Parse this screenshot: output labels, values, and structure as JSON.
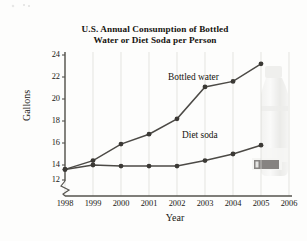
{
  "chart": {
    "title_line1": "U.S. Annual Consumption of Bottled",
    "title_line2": "Water or Diet Soda per Person",
    "xlabel": "Year",
    "ylabel": "Gallons",
    "axis_break_note": "y-axis break below 12"
  },
  "chart_data": {
    "type": "line",
    "title": "U.S. Annual Consumption of Bottled Water or Diet Soda per Person",
    "xlabel": "Year",
    "ylabel": "Gallons",
    "x": [
      1998,
      1999,
      2000,
      2001,
      2002,
      2003,
      2004,
      2005
    ],
    "xtick_labels": [
      "1998",
      "1999",
      "2000",
      "2001",
      "2002",
      "2003",
      "2004",
      "2005",
      "2006"
    ],
    "ytick_labels": [
      "12",
      "14",
      "16",
      "18",
      "20",
      "22",
      "24"
    ],
    "xlim": [
      1998,
      2006
    ],
    "ylim": [
      12,
      24
    ],
    "grid": true,
    "legend": "inline-annotations",
    "series": [
      {
        "name": "Bottled water",
        "values": [
          13.6,
          14.4,
          15.9,
          16.8,
          18.2,
          21.1,
          21.6,
          23.2
        ]
      },
      {
        "name": "Diet soda",
        "values": [
          13.6,
          14.0,
          13.9,
          13.9,
          13.9,
          14.4,
          15.0,
          15.8
        ]
      }
    ]
  },
  "icons": {
    "bottle": "water-bottle-photo"
  }
}
